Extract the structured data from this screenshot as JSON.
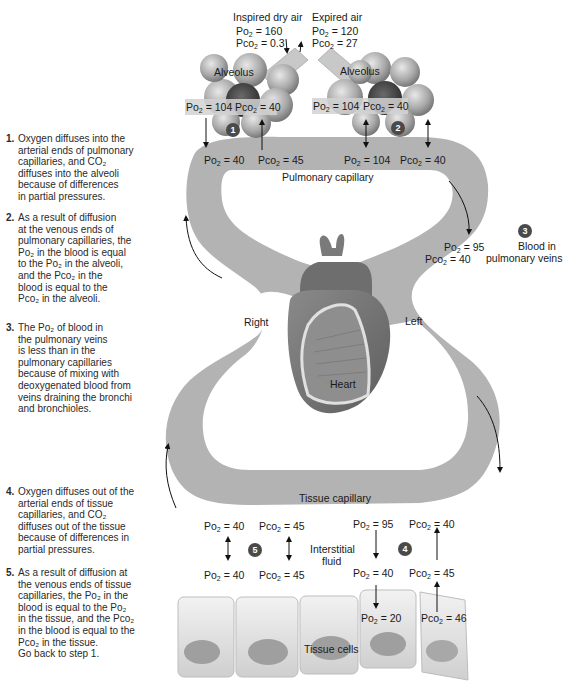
{
  "figure": {
    "inspired_air": {
      "title": "Inspired dry air",
      "po2": "= 160",
      "pco2": "= 0.3"
    },
    "expired_air": {
      "title": "Expired air",
      "po2": "= 120",
      "pco2": "= 27"
    },
    "alveolus_left": {
      "label": "Alveolus",
      "po2": "= 104",
      "pco2": "= 40"
    },
    "alveolus_right": {
      "label": "Alveolus",
      "po2": "= 104",
      "pco2": "= 40"
    },
    "pulmonary_capillary": {
      "label": "Pulmonary capillary",
      "arterial_po2": "= 40",
      "arterial_pco2": "= 45",
      "venous_po2": "= 104",
      "venous_pco2": "= 40"
    },
    "pulmonary_veins": {
      "label_line1": "Blood in",
      "label_line2": "pulmonary veins",
      "po2": "= 95",
      "pco2": "= 40"
    },
    "heart": {
      "label": "Heart",
      "right": "Right",
      "left": "Left"
    },
    "tissue_capillary": {
      "label": "Tissue capillary",
      "venous_po2": "= 40",
      "venous_pco2": "= 45",
      "arterial_po2": "= 95",
      "arterial_pco2": "= 40"
    },
    "interstitial": {
      "label_line1": "Interstitial",
      "label_line2": "fluid",
      "left_po2": "= 40",
      "left_pco2": "= 45",
      "right_po2": "= 40",
      "right_pco2": "= 45"
    },
    "tissue_cells": {
      "label": "Tissue cells",
      "po2": "= 20",
      "pco2": "= 46"
    },
    "po2_symbol": "Po",
    "pco2_symbol": "Pco",
    "sub2": "2",
    "badges": [
      "1",
      "2",
      "3",
      "4",
      "5"
    ]
  },
  "steps": [
    {
      "num": "1.",
      "lines": [
        "Oxygen diffuses into the",
        "arterial ends of pulmonary",
        "capillaries, and CO₂",
        "diffuses into the alveoli",
        "because of differences",
        "in partial pressures."
      ]
    },
    {
      "num": "2.",
      "lines": [
        "As a result of diffusion",
        "at the venous ends of",
        "pulmonary capillaries, the",
        "Po₂ in the blood is equal",
        "to the Po₂ in the alveoli,",
        "and the Pco₂ in the",
        "blood is equal to the",
        "Pco₂ in the alveoli."
      ]
    },
    {
      "num": "3.",
      "lines": [
        "The Po₂ of blood in",
        "the pulmonary veins",
        "is less than in the",
        "pulmonary capillaries",
        "because of mixing with",
        "deoxygenated blood from",
        "veins draining the bronchi",
        "and bronchioles."
      ]
    },
    {
      "num": "4.",
      "lines": [
        "Oxygen diffuses out of the",
        "arterial ends of tissue",
        "capillaries, and CO₂",
        "diffuses out of the tissue",
        "because of differences in",
        "partial pressures."
      ]
    },
    {
      "num": "5.",
      "lines": [
        "As a result of diffusion at",
        "the venous ends of tissue",
        "capillaries, the Po₂ in the",
        "blood  is equal to the Po₂",
        "in the tissue, and the Pco₂",
        "in the blood is equal to the",
        "Pco₂ in the tissue.",
        "Go back to step 1."
      ]
    }
  ],
  "colors": {
    "capillary": "#b3b3b3",
    "badge": "#4a4a4a",
    "heart_dark": "#7a7a7a",
    "heart_light": "#d9d9d9",
    "cell": "#dcdcdc",
    "nucleus": "#9a9a9a"
  }
}
